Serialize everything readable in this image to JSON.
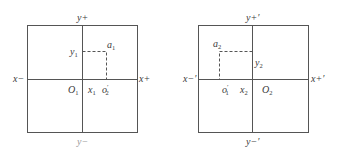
{
  "panels": [
    {
      "id": "left",
      "frame": {
        "x": 27,
        "y": 25,
        "w": 110,
        "h": 107
      },
      "origin": {
        "x": 82,
        "y": 79
      },
      "point": {
        "x": 106,
        "y": 51
      },
      "labels": {
        "y_plus": "y+",
        "y_minus": "y−",
        "x_minus": "x−",
        "x_plus": "x+",
        "origin_main": "O",
        "origin_sub": "1",
        "x_coord_main": "x",
        "x_coord_sub": "1",
        "y_coord_main": "y",
        "y_coord_sub": "1",
        "point_main": "a",
        "point_sub": "1",
        "projected_main": "o",
        "projected_sup": "′",
        "projected_sub": "2"
      }
    },
    {
      "id": "right",
      "frame": {
        "x": 198,
        "y": 25,
        "w": 110,
        "h": 107
      },
      "origin": {
        "x": 252,
        "y": 79
      },
      "point": {
        "x": 219,
        "y": 51
      },
      "labels": {
        "y_plus": "y+′",
        "y_minus": "y−′",
        "x_minus": "x−′",
        "x_plus": "x+′",
        "origin_main": "O",
        "origin_sub": "2",
        "x_coord_main": "x",
        "x_coord_sub": "2",
        "y_coord_main": "y",
        "y_coord_sub": "2",
        "point_main": "a",
        "point_sub": "2",
        "projected_main": "o",
        "projected_sup": "′",
        "projected_sub": "1"
      }
    }
  ],
  "colors": {
    "line": "#555555",
    "text": "#3a3a3a",
    "faint_text": "#9a9a9a",
    "background": "#ffffff"
  }
}
